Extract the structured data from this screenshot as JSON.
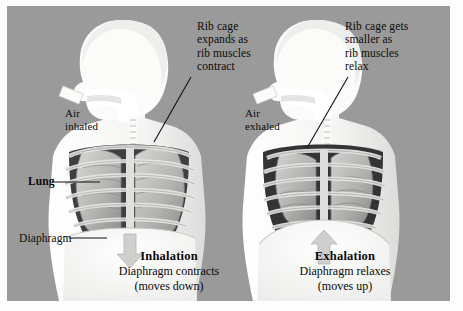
{
  "figure": {
    "background_color": "#9a9a9a",
    "panel_border_color": "#ffffff"
  },
  "annotations": {
    "ribcage_inhale": "Rib cage\nexpands as\nrib muscles\ncontract",
    "ribcage_exhale": "Rib cage gets\nsmaller as\nrib muscles\nrelax",
    "air_inhaled": "Air\ninhaled",
    "air_exhaled": "Air\nexhaled",
    "lung": "Lung",
    "diaphragm": "Diaphragm"
  },
  "captions": [
    {
      "id": "inhalation",
      "title": "Inhalation",
      "line1": "Diaphragm contracts",
      "line2": "(moves down)",
      "arrow_direction": "down"
    },
    {
      "id": "exhalation",
      "title": "Exhalation",
      "line1": "Diaphragm relaxes",
      "line2": "(moves up)",
      "arrow_direction": "up"
    }
  ],
  "icons": {
    "air_arrow_left": "arrow-into-mouth-icon",
    "air_arrow_right": "arrow-out-of-mouth-icon",
    "diaphragm_arrow_down": "arrow-down-icon",
    "diaphragm_arrow_up": "arrow-up-icon"
  },
  "colors": {
    "background": "#9a9a9a",
    "body_silhouette": "#f2f2f0",
    "lung": "#b8b8b6",
    "lung_shadow": "#8f8f8d",
    "rib": "#d8d8d6",
    "cavity_dark": "#3c3c3c",
    "text": "#0b0b0b",
    "leader_line": "#111111"
  }
}
